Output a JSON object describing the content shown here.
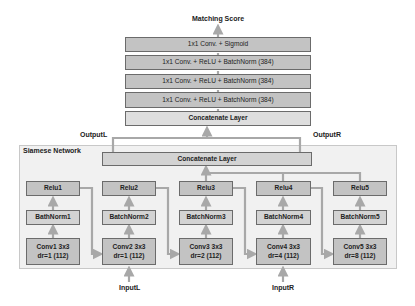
{
  "title": "Matching Score",
  "head_stack": [
    {
      "label": "1x1 Conv. + Sigmoid"
    },
    {
      "label": "1x1 Conv. + ReLU + BatchNorm (384)"
    },
    {
      "label": "1x1 Conv. + ReLU + BatchNorm (384)"
    },
    {
      "label": "1x1 Conv. + ReLU + BatchNorm (384)"
    }
  ],
  "top_concat": "Concatenate Layer",
  "output_left": "OutputL",
  "output_right": "OutputR",
  "siamese": {
    "title": "Siamese Network",
    "concat": "Concatenate Layer",
    "columns": [
      {
        "relu": "Relu1",
        "bn": "BathNorm1",
        "conv_line1": "Conv1 3x3",
        "conv_line2": "dr=1 (112)"
      },
      {
        "relu": "Relu2",
        "bn": "BatchNorm2",
        "conv_line1": "Conv2 3x3",
        "conv_line2": "dr=1 (112)"
      },
      {
        "relu": "Relu3",
        "bn": "BatchNorm3",
        "conv_line1": "Conv3 3x3",
        "conv_line2": "dr=2 (112)"
      },
      {
        "relu": "Relu4",
        "bn": "BatchNorm4",
        "conv_line1": "Conv4 3x3",
        "conv_line2": "dr=4 (112)"
      },
      {
        "relu": "Relu5",
        "bn": "BatchNorm5",
        "conv_line1": "Conv5 3x3",
        "conv_line2": "dr=8 (112)"
      }
    ]
  },
  "input_left": "InputL",
  "input_right": "InputR",
  "colors": {
    "box_dark": "#c3c3c3",
    "box_mid": "#d3d3d3",
    "box_light": "#dedede",
    "arrow": "#a8a8a8",
    "container": "#f1f1f1"
  }
}
